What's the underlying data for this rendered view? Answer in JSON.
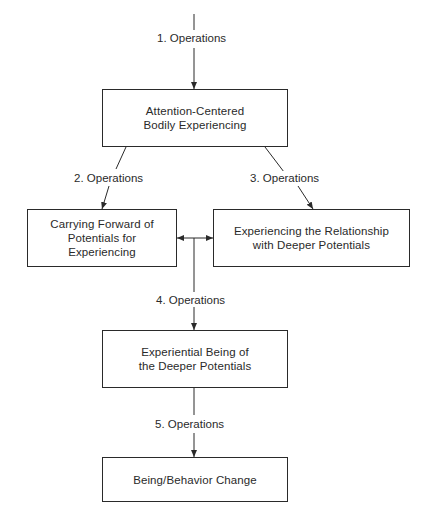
{
  "diagram": {
    "type": "flowchart",
    "nodes": [
      {
        "id": "n1",
        "lines": [
          "Attention-Centered",
          "Bodily Experiencing"
        ]
      },
      {
        "id": "n2",
        "lines": [
          "Carrying Forward of",
          "Potentials for",
          "Experiencing"
        ]
      },
      {
        "id": "n3",
        "lines": [
          "Experiencing the Relationship",
          "with Deeper Potentials"
        ]
      },
      {
        "id": "n4",
        "lines": [
          "Experiential Being of",
          "the Deeper Potentials"
        ]
      },
      {
        "id": "n5",
        "lines": [
          "Being/Behavior Change"
        ]
      }
    ],
    "edges": [
      {
        "from": "top",
        "to": "n1",
        "label": "1. Operations"
      },
      {
        "from": "n1",
        "to": "n2",
        "label": "2. Operations"
      },
      {
        "from": "n1",
        "to": "n3",
        "label": "3. Operations"
      },
      {
        "from": "n2",
        "to": "n3",
        "label": "",
        "bidirectional": true
      },
      {
        "from": "n2-n3 connector",
        "to": "n4",
        "label": "4. Operations"
      },
      {
        "from": "n4",
        "to": "n5",
        "label": "5. Operations"
      }
    ],
    "labels": {
      "op1": "1. Operations",
      "op2": "2. Operations",
      "op3": "3. Operations",
      "op4": "4. Operations",
      "op5": "5. Operations"
    },
    "caption": ""
  },
  "colors": {
    "line": "#2a2a2a",
    "background": "#ffffff"
  }
}
